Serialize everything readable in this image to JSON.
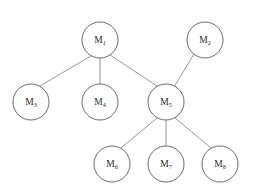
{
  "diagram": {
    "canvas": {
      "width": 253,
      "height": 194,
      "background": "#ffffff"
    },
    "style": {
      "node_stroke": "#6b6b6b",
      "node_fill": "#ffffff",
      "edge_stroke": "#8a8a8a",
      "label_color": "#2a2a2a",
      "node_radius": 18
    },
    "nodes": [
      {
        "id": "M1",
        "base": "M",
        "subscript": "1",
        "label": "M1",
        "cx": 100,
        "cy": 40,
        "r": 18
      },
      {
        "id": "M2",
        "base": "M",
        "subscript": "2",
        "label": "M2",
        "cx": 205,
        "cy": 40,
        "r": 18
      },
      {
        "id": "M3",
        "base": "M",
        "subscript": "3",
        "label": "M3",
        "cx": 31,
        "cy": 102,
        "r": 18
      },
      {
        "id": "M4",
        "base": "M",
        "subscript": "4",
        "label": "M4",
        "cx": 100,
        "cy": 102,
        "r": 18
      },
      {
        "id": "M5",
        "base": "M",
        "subscript": "5",
        "label": "M5",
        "cx": 166,
        "cy": 102,
        "r": 18
      },
      {
        "id": "M6",
        "base": "M",
        "subscript": "6",
        "label": "M6",
        "cx": 112,
        "cy": 164,
        "r": 18
      },
      {
        "id": "M7",
        "base": "M",
        "subscript": "7",
        "label": "M7",
        "cx": 166,
        "cy": 164,
        "r": 18
      },
      {
        "id": "M8",
        "base": "M",
        "subscript": "8",
        "label": "M8",
        "cx": 220,
        "cy": 164,
        "r": 18
      }
    ],
    "edges": [
      {
        "id": "e1",
        "from": "M1",
        "to": "M3",
        "x1": 91,
        "y1": 56,
        "x2": 40,
        "y2": 86
      },
      {
        "id": "e2",
        "from": "M1",
        "to": "M4",
        "x1": 100,
        "y1": 58,
        "x2": 100,
        "y2": 84
      },
      {
        "id": "e3",
        "from": "M1",
        "to": "M5",
        "x1": 110,
        "y1": 55,
        "x2": 157,
        "y2": 86
      },
      {
        "id": "e4",
        "from": "M2",
        "to": "M5",
        "x1": 194,
        "y1": 54,
        "x2": 174,
        "y2": 87
      },
      {
        "id": "e5",
        "from": "M5",
        "to": "M6",
        "x1": 157,
        "y1": 118,
        "x2": 121,
        "y2": 148
      },
      {
        "id": "e6",
        "from": "M5",
        "to": "M7",
        "x1": 166,
        "y1": 120,
        "x2": 166,
        "y2": 146
      },
      {
        "id": "e7",
        "from": "M5",
        "to": "M8",
        "x1": 175,
        "y1": 118,
        "x2": 211,
        "y2": 148
      }
    ]
  }
}
